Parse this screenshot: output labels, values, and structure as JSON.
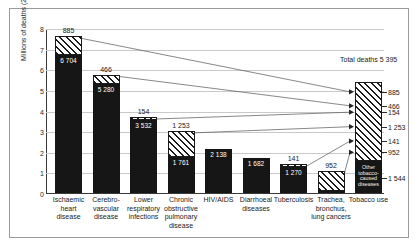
{
  "chart_data": {
    "type": "bar",
    "title": "",
    "xlabel": "",
    "ylabel": "Millions of deaths (2005)",
    "ylim": [
      0,
      8
    ],
    "yticks": [
      "0",
      "1",
      "2",
      "3",
      "4",
      "5",
      "6",
      "7",
      "8"
    ],
    "grid": true,
    "legend": null,
    "stacked": true,
    "units": "thousands of deaths",
    "categories": [
      "Ischaemic heart disease",
      "Cerebro-vascular disease",
      "Lower respiratory infections",
      "Chronic obstructive pulmonary disease",
      "HIV/AIDS",
      "Diarrhoeal diseases",
      "Tuberculosis",
      "Trachea, bronchus, lung cancers",
      "Tobacco use"
    ],
    "series": [
      {
        "name": "Deaths not caused by tobacco",
        "values": [
          6704,
          5280,
          3532,
          1761,
          2138,
          1682,
          1270,
          118,
          1544
        ]
      },
      {
        "name": "Tobacco-caused deaths",
        "values": [
          885,
          466,
          154,
          1253,
          0,
          0,
          141,
          952,
          3851
        ]
      }
    ],
    "annotations": {
      "total_deaths": "Total deaths 5 395",
      "other_block": "Other tobacco-caused diseases"
    },
    "tobacco_breakdown": [
      "885",
      "466",
      "154",
      "1 253",
      "141",
      "952",
      "1 544"
    ]
  },
  "axis": {
    "ylabel": "Millions of deaths (2005)",
    "ticks": [
      "8",
      "7",
      "6",
      "5",
      "4",
      "3",
      "2",
      "1",
      "0"
    ]
  },
  "bars": [
    {
      "key": "ischaemic",
      "category_lines": [
        "Ischaemic",
        "heart",
        "disease"
      ],
      "dark_value": 6704,
      "dark_label": "6 704",
      "hatch_value": 885,
      "hatch_label": "885"
    },
    {
      "key": "cerebrovascular",
      "category_lines": [
        "Cerebro-",
        "vascular",
        "disease"
      ],
      "dark_value": 5280,
      "dark_label": "5 280",
      "hatch_value": 466,
      "hatch_label": "466"
    },
    {
      "key": "lower-respiratory",
      "category_lines": [
        "Lower",
        "respiratory",
        "infections"
      ],
      "dark_value": 3532,
      "dark_label": "3 532",
      "hatch_value": 154,
      "hatch_label": "154"
    },
    {
      "key": "copd",
      "category_lines": [
        "Chronic",
        "obstructive",
        "pulmonary",
        "disease"
      ],
      "dark_value": 1761,
      "dark_label": "1 761",
      "hatch_value": 1253,
      "hatch_label": "1 253"
    },
    {
      "key": "hiv-aids",
      "category_lines": [
        "HIV/AIDS"
      ],
      "dark_value": 2138,
      "dark_label": "2 138",
      "hatch_value": 0,
      "hatch_label": ""
    },
    {
      "key": "diarrhoeal",
      "category_lines": [
        "Diarrhoeal",
        "diseases"
      ],
      "dark_value": 1682,
      "dark_label": "1 682",
      "hatch_value": 0,
      "hatch_label": ""
    },
    {
      "key": "tuberculosis",
      "category_lines": [
        "Tuberculosis"
      ],
      "dark_value": 1270,
      "dark_label": "1 270",
      "hatch_value": 141,
      "hatch_label": "141"
    },
    {
      "key": "trachea",
      "category_lines": [
        "Trachea,",
        "bronchus,",
        "lung cancers"
      ],
      "dark_value": 118,
      "dark_label": "118",
      "hatch_value": 952,
      "hatch_label": "952"
    },
    {
      "key": "tobacco-use",
      "category_lines": [
        "Tobacco use"
      ],
      "dark_value": 1544,
      "dark_label": "",
      "hatch_value": 3851,
      "hatch_label": "",
      "other_block_label": "Other tobacco-caused diseases"
    }
  ],
  "side": {
    "total_note": "Total deaths 5 395",
    "labels": [
      "885",
      "466",
      "154",
      "1 253",
      "141",
      "952",
      "1 544"
    ]
  }
}
